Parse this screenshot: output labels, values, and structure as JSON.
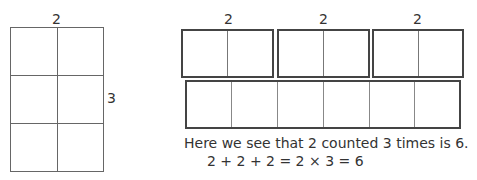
{
  "left_array": {
    "columns_label": "2",
    "rows_label": "3",
    "rows": 3,
    "columns": 2
  },
  "groups": [
    {
      "label": "2",
      "cells": 2
    },
    {
      "label": "2",
      "cells": 2
    },
    {
      "label": "2",
      "cells": 2
    }
  ],
  "combined": {
    "cells": 6
  },
  "caption": {
    "sentence": "Here we see that 2 counted 3 times is 6.",
    "equation": "2 + 2 + 2 = 2 × 3 = 6"
  }
}
